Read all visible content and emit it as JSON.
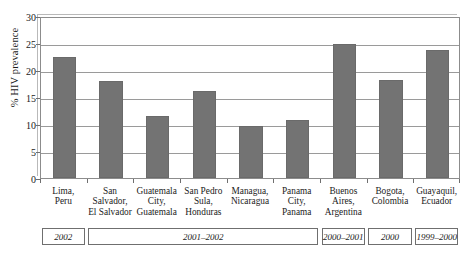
{
  "chart_data": {
    "type": "bar",
    "title": "",
    "xlabel": "",
    "ylabel": "% HIV prevalence",
    "ylim": [
      0,
      30
    ],
    "yticks": [
      0,
      5,
      10,
      15,
      20,
      25,
      30
    ],
    "ytick_labels": [
      "0",
      "5",
      "10",
      "15",
      "20",
      "25",
      "30"
    ],
    "grid": true,
    "legend": false,
    "bar_color": "#737373",
    "categories": [
      "Lima, Peru",
      "San Salvador, El Salvador",
      "Guatemala City, Guatemala",
      "San Pedro Sula, Honduras",
      "Managua, Nicaragua",
      "Panama City, Panama",
      "Buenos Aires, Argentina",
      "Bogota, Colombia",
      "Guayaquil, Ecuador"
    ],
    "category_lines": [
      [
        "Lima,",
        "Peru"
      ],
      [
        "San",
        "Salvador,",
        "El Salvador"
      ],
      [
        "Guatemala",
        "City,",
        "Guatemala"
      ],
      [
        "San Pedro",
        "Sula,",
        "Honduras"
      ],
      [
        "Managua,",
        "Nicaragua"
      ],
      [
        "Panama",
        "City,",
        "Panama"
      ],
      [
        "Buenos",
        "Aires,",
        "Argentina"
      ],
      [
        "Bogota,",
        "Colombia"
      ],
      [
        "Guayaquil,",
        "Ecuador"
      ]
    ],
    "values": [
      22.4,
      17.9,
      11.5,
      16.2,
      9.6,
      10.8,
      24.8,
      18.2,
      23.7
    ],
    "periods": [
      {
        "label": "2002",
        "start_index": 0,
        "end_index": 0
      },
      {
        "label": "2001–2002",
        "start_index": 1,
        "end_index": 5
      },
      {
        "label": "2000–2001",
        "start_index": 6,
        "end_index": 6
      },
      {
        "label": "2000",
        "start_index": 7,
        "end_index": 7
      },
      {
        "label": "1999–2000",
        "start_index": 8,
        "end_index": 8
      }
    ]
  }
}
